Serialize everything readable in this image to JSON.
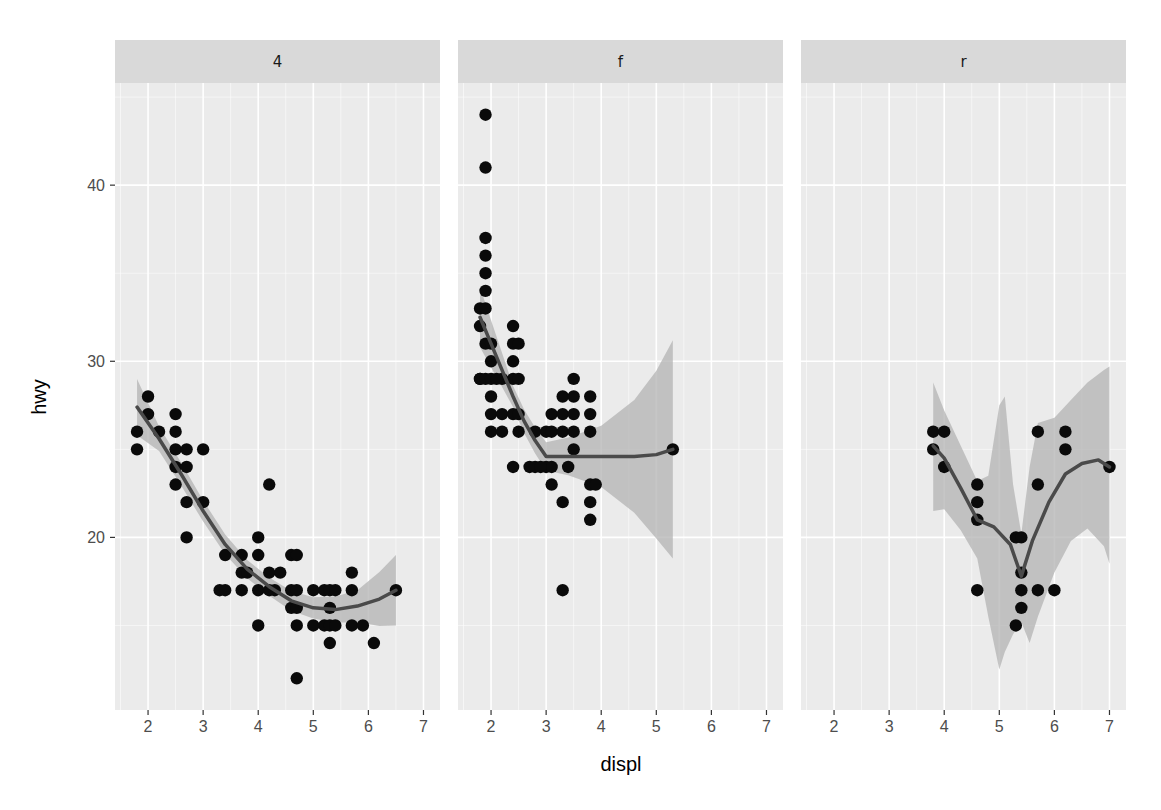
{
  "chart_data": {
    "type": "scatter",
    "title": "",
    "xlabel": "displ",
    "ylabel": "hwy",
    "facet_by": "drv",
    "xlim": [
      1.4,
      7.3
    ],
    "ylim": [
      10.2,
      45.8
    ],
    "x_ticks": [
      2,
      3,
      4,
      5,
      6,
      7
    ],
    "y_ticks": [
      20,
      30,
      40
    ],
    "grid": true,
    "smooth": "loess with confidence ribbon",
    "panels": [
      {
        "label": "4",
        "points": [
          [
            1.8,
            26
          ],
          [
            1.8,
            25
          ],
          [
            2.0,
            28
          ],
          [
            2.0,
            27
          ],
          [
            2.2,
            26
          ],
          [
            2.5,
            27
          ],
          [
            2.5,
            26
          ],
          [
            2.5,
            25
          ],
          [
            2.5,
            24
          ],
          [
            2.5,
            23
          ],
          [
            2.7,
            25
          ],
          [
            2.7,
            24
          ],
          [
            2.7,
            22
          ],
          [
            2.7,
            20
          ],
          [
            3.0,
            25
          ],
          [
            3.0,
            22
          ],
          [
            3.3,
            17
          ],
          [
            3.4,
            17
          ],
          [
            3.4,
            19
          ],
          [
            3.7,
            18
          ],
          [
            3.7,
            17
          ],
          [
            3.7,
            19
          ],
          [
            4.0,
            20
          ],
          [
            4.0,
            19
          ],
          [
            4.0,
            17
          ],
          [
            4.0,
            15
          ],
          [
            4.2,
            18
          ],
          [
            4.2,
            17
          ],
          [
            4.2,
            23
          ],
          [
            4.4,
            18
          ],
          [
            4.6,
            17
          ],
          [
            4.6,
            16
          ],
          [
            4.6,
            19
          ],
          [
            4.7,
            17
          ],
          [
            4.7,
            16
          ],
          [
            4.7,
            15
          ],
          [
            4.7,
            19
          ],
          [
            4.7,
            12
          ],
          [
            5.2,
            17
          ],
          [
            5.2,
            15
          ],
          [
            5.3,
            17
          ],
          [
            5.3,
            16
          ],
          [
            5.3,
            15
          ],
          [
            5.3,
            14
          ],
          [
            5.4,
            17
          ],
          [
            5.4,
            15
          ],
          [
            5.7,
            18
          ],
          [
            5.7,
            17
          ],
          [
            5.7,
            15
          ],
          [
            5.9,
            15
          ],
          [
            6.1,
            14
          ],
          [
            6.5,
            17
          ],
          [
            5.0,
            17
          ],
          [
            5.0,
            15
          ],
          [
            3.8,
            18
          ],
          [
            4.3,
            17
          ]
        ],
        "smooth": [
          [
            1.8,
            27.4
          ],
          [
            2.2,
            25.6
          ],
          [
            2.6,
            23.6
          ],
          [
            3.0,
            21.5
          ],
          [
            3.4,
            19.6
          ],
          [
            3.8,
            18.2
          ],
          [
            4.2,
            17.2
          ],
          [
            4.6,
            16.4
          ],
          [
            5.0,
            16.0
          ],
          [
            5.4,
            15.9
          ],
          [
            5.8,
            16.1
          ],
          [
            6.2,
            16.5
          ],
          [
            6.5,
            17.0
          ]
        ],
        "ribbon_halfwidth": [
          [
            1.8,
            1.6
          ],
          [
            2.2,
            0.7
          ],
          [
            3.0,
            0.6
          ],
          [
            4.0,
            0.5
          ],
          [
            5.0,
            0.6
          ],
          [
            5.8,
            0.9
          ],
          [
            6.5,
            2.0
          ]
        ]
      },
      {
        "label": "f",
        "points": [
          [
            1.8,
            29
          ],
          [
            1.8,
            32
          ],
          [
            1.8,
            33
          ],
          [
            1.9,
            44
          ],
          [
            1.9,
            41
          ],
          [
            1.8,
            29
          ],
          [
            1.9,
            37
          ],
          [
            1.9,
            36
          ],
          [
            1.9,
            35
          ],
          [
            1.9,
            34
          ],
          [
            1.9,
            33
          ],
          [
            1.9,
            31
          ],
          [
            1.9,
            29
          ],
          [
            2.0,
            30
          ],
          [
            2.0,
            29
          ],
          [
            2.0,
            28
          ],
          [
            2.0,
            27
          ],
          [
            2.0,
            26
          ],
          [
            2.2,
            29
          ],
          [
            2.2,
            27
          ],
          [
            2.2,
            26
          ],
          [
            2.4,
            32
          ],
          [
            2.4,
            31
          ],
          [
            2.4,
            30
          ],
          [
            2.4,
            29
          ],
          [
            2.4,
            27
          ],
          [
            2.4,
            24
          ],
          [
            2.5,
            31
          ],
          [
            2.5,
            29
          ],
          [
            2.5,
            27
          ],
          [
            2.5,
            26
          ],
          [
            2.0,
            31
          ],
          [
            2.1,
            29
          ],
          [
            2.7,
            24
          ],
          [
            2.8,
            26
          ],
          [
            2.8,
            24
          ],
          [
            3.0,
            26
          ],
          [
            3.0,
            24
          ],
          [
            3.1,
            27
          ],
          [
            3.1,
            26
          ],
          [
            3.1,
            24
          ],
          [
            3.1,
            23
          ],
          [
            3.3,
            28
          ],
          [
            3.3,
            27
          ],
          [
            3.3,
            26
          ],
          [
            3.3,
            22
          ],
          [
            3.3,
            17
          ],
          [
            3.5,
            29
          ],
          [
            3.5,
            28
          ],
          [
            3.5,
            27
          ],
          [
            3.5,
            26
          ],
          [
            3.5,
            25
          ],
          [
            3.8,
            28
          ],
          [
            3.8,
            27
          ],
          [
            3.8,
            26
          ],
          [
            3.8,
            23
          ],
          [
            3.8,
            22
          ],
          [
            3.8,
            21
          ],
          [
            3.9,
            23
          ],
          [
            3.4,
            24
          ],
          [
            2.9,
            24
          ],
          [
            5.3,
            25
          ]
        ],
        "smooth": [
          [
            1.8,
            32.5
          ],
          [
            2.0,
            31.0
          ],
          [
            2.2,
            29.5
          ],
          [
            2.4,
            28.0
          ],
          [
            2.6,
            26.6
          ],
          [
            2.8,
            25.5
          ],
          [
            3.0,
            24.6
          ],
          [
            3.4,
            24.6
          ],
          [
            4.0,
            24.6
          ],
          [
            4.6,
            24.6
          ],
          [
            5.0,
            24.7
          ],
          [
            5.3,
            25.0
          ]
        ],
        "ribbon_halfwidth": [
          [
            1.8,
            1.7
          ],
          [
            2.4,
            0.6
          ],
          [
            3.0,
            0.8
          ],
          [
            3.6,
            1.2
          ],
          [
            4.2,
            2.0
          ],
          [
            4.8,
            3.8
          ],
          [
            5.3,
            6.2
          ]
        ]
      },
      {
        "label": "r",
        "points": [
          [
            3.8,
            26
          ],
          [
            3.8,
            25
          ],
          [
            4.0,
            26
          ],
          [
            4.0,
            24
          ],
          [
            4.6,
            23
          ],
          [
            4.6,
            22
          ],
          [
            4.6,
            21
          ],
          [
            4.6,
            17
          ],
          [
            5.3,
            20
          ],
          [
            5.4,
            20
          ],
          [
            5.4,
            18
          ],
          [
            5.4,
            17
          ],
          [
            5.4,
            16
          ],
          [
            5.3,
            15
          ],
          [
            5.7,
            26
          ],
          [
            5.7,
            23
          ],
          [
            5.7,
            17
          ],
          [
            6.0,
            17
          ],
          [
            6.2,
            26
          ],
          [
            6.2,
            25
          ],
          [
            7.0,
            24
          ]
        ],
        "smooth": [
          [
            3.8,
            25.2
          ],
          [
            4.0,
            24.5
          ],
          [
            4.3,
            22.8
          ],
          [
            4.6,
            21.0
          ],
          [
            4.9,
            20.6
          ],
          [
            5.2,
            19.6
          ],
          [
            5.4,
            17.8
          ],
          [
            5.6,
            19.8
          ],
          [
            5.9,
            22.0
          ],
          [
            6.2,
            23.6
          ],
          [
            6.5,
            24.2
          ],
          [
            6.8,
            24.4
          ],
          [
            7.0,
            24.0
          ]
        ],
        "ribbon": [
          [
            3.8,
            28.8,
            21.5
          ],
          [
            4.0,
            27.2,
            21.6
          ],
          [
            4.3,
            25.2,
            20.4
          ],
          [
            4.6,
            23.2,
            18.8
          ],
          [
            4.8,
            23.5,
            15.5
          ],
          [
            5.0,
            27.5,
            12.5
          ],
          [
            5.1,
            28.0,
            13.5
          ],
          [
            5.25,
            23.0,
            14.5
          ],
          [
            5.4,
            20.2,
            15.2
          ],
          [
            5.55,
            24.0,
            14.0
          ],
          [
            5.7,
            26.5,
            15.5
          ],
          [
            6.0,
            26.8,
            18.0
          ],
          [
            6.3,
            27.8,
            19.8
          ],
          [
            6.6,
            28.8,
            20.5
          ],
          [
            6.9,
            29.5,
            19.5
          ],
          [
            7.0,
            29.7,
            18.5
          ]
        ]
      }
    ]
  },
  "colors": {
    "panel_bg": "#ebebeb",
    "strip_bg": "#d9d9d9",
    "grid_major": "#ffffff",
    "point": "#0a0a0a",
    "smooth_line": "#4a4a4a",
    "ribbon": "#b3b3b3"
  }
}
